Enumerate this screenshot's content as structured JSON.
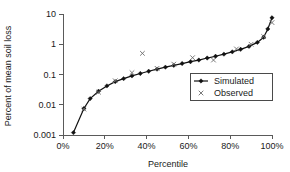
{
  "chart_data": {
    "type": "line",
    "title": "",
    "subtitle": "",
    "xlabel": "Percentile",
    "ylabel": "Percent of mean soil loss",
    "xlim": [
      0,
      100
    ],
    "ylim": [
      0.001,
      10
    ],
    "yscale": "log",
    "xscale": "linear",
    "grid": false,
    "legend_position": "inside-bottom-right",
    "xticks": [
      0,
      20,
      40,
      60,
      80,
      100
    ],
    "xticklabels": [
      "0%",
      "20%",
      "40%",
      "60%",
      "80%",
      "100%"
    ],
    "yticks": [
      0.001,
      0.01,
      0.1,
      1,
      10
    ],
    "yticklabels": [
      "0.001",
      "0.01",
      "0.1",
      "1",
      "10"
    ],
    "series": [
      {
        "name": "Simulated",
        "marker": "diamond",
        "style": "line-with-markers",
        "color": "#111111",
        "x": [
          5,
          10,
          13,
          17,
          21,
          25,
          29,
          33,
          37,
          41,
          45,
          49,
          53,
          57,
          61,
          65,
          69,
          73,
          77,
          81,
          85,
          89,
          93,
          96,
          98,
          100
        ],
        "y": [
          0.0012,
          0.0075,
          0.016,
          0.028,
          0.042,
          0.058,
          0.073,
          0.09,
          0.108,
          0.128,
          0.15,
          0.175,
          0.2,
          0.23,
          0.265,
          0.3,
          0.35,
          0.4,
          0.47,
          0.56,
          0.68,
          0.85,
          1.15,
          1.7,
          3.2,
          7.5
        ]
      },
      {
        "name": "Observed",
        "marker": "cross",
        "style": "markers-only",
        "color": "#6b6b6b",
        "x": [
          10,
          17,
          25,
          33,
          38,
          45,
          53,
          62,
          72,
          83,
          90,
          96,
          100
        ],
        "y": [
          0.0072,
          0.026,
          0.062,
          0.115,
          0.5,
          0.16,
          0.22,
          0.36,
          0.3,
          0.7,
          1.0,
          1.8,
          5.2
        ]
      }
    ]
  },
  "legend": {
    "entries": [
      {
        "label": "Simulated",
        "marker": "diamond"
      },
      {
        "label": "Observed",
        "marker": "cross"
      }
    ]
  }
}
